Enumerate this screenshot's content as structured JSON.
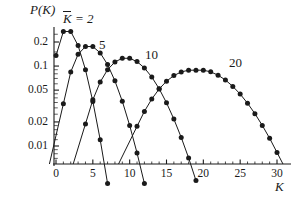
{
  "chart_data": {
    "type": "line",
    "title": "",
    "subtitle": "",
    "xlabel": "K",
    "ylabel": "P(K)",
    "yscale": "log",
    "xscale": "linear",
    "xlim": [
      0,
      30
    ],
    "ylim": [
      0.007,
      0.27
    ],
    "grid": false,
    "legend_position": "inline-annotations",
    "x_ticks": [
      "0",
      "5",
      "10",
      "15",
      "20",
      "25",
      "30"
    ],
    "x_tick_values": [
      0,
      5,
      10,
      15,
      20,
      25,
      30
    ],
    "y_ticks": [
      "0.2",
      "0.1",
      "0.05",
      "0.02",
      "0.01"
    ],
    "y_tick_values": [
      0.2,
      0.1,
      0.05,
      0.02,
      0.01
    ],
    "annotations": [
      {
        "text": "K = 2",
        "overline": "K",
        "x": 2.2,
        "y": 0.255
      },
      {
        "text": "5",
        "x": 6.5,
        "y": 0.185
      },
      {
        "text": "10",
        "x": 13.0,
        "y": 0.155
      },
      {
        "text": "20",
        "x": 24.0,
        "y": 0.125
      }
    ],
    "series": [
      {
        "name": "K = 2",
        "mean": 2,
        "marker": "filled-circle",
        "x": [
          0,
          1,
          2,
          3,
          4,
          5,
          6,
          7
        ],
        "values": [
          0.1353,
          0.2707,
          0.2707,
          0.1804,
          0.0902,
          0.0361,
          0.012,
          0.0034
        ]
      },
      {
        "name": "5",
        "mean": 5,
        "marker": "filled-circle",
        "x": [
          1,
          2,
          3,
          4,
          5,
          6,
          7,
          8,
          9,
          10,
          11,
          12
        ],
        "values": [
          0.0337,
          0.0842,
          0.1404,
          0.1755,
          0.1755,
          0.1462,
          0.1044,
          0.0653,
          0.0363,
          0.0181,
          0.0082,
          0.0034
        ]
      },
      {
        "name": "10",
        "mean": 10,
        "marker": "filled-circle",
        "x": [
          4,
          5,
          6,
          7,
          8,
          9,
          10,
          11,
          12,
          13,
          14,
          15,
          16,
          17,
          18,
          19
        ],
        "values": [
          0.0189,
          0.0378,
          0.0631,
          0.0901,
          0.1126,
          0.1251,
          0.1251,
          0.1137,
          0.0948,
          0.0729,
          0.0521,
          0.0347,
          0.0217,
          0.0128,
          0.0071,
          0.0037
        ]
      },
      {
        "name": "20",
        "mean": 20,
        "marker": "filled-circle",
        "x": [
          11,
          12,
          13,
          14,
          15,
          16,
          17,
          18,
          19,
          20,
          21,
          22,
          23,
          24,
          25,
          26,
          27,
          28,
          29,
          30
        ],
        "values": [
          0.0176,
          0.0271,
          0.0387,
          0.0516,
          0.0646,
          0.076,
          0.0844,
          0.0888,
          0.0888,
          0.0888,
          0.0846,
          0.0769,
          0.0669,
          0.0557,
          0.0446,
          0.0343,
          0.0254,
          0.0181,
          0.0125,
          0.0083
        ]
      }
    ]
  },
  "style": {
    "line_color": "#1a1a1a",
    "marker_color": "#1a1a1a",
    "axis_color": "#1a1a1a",
    "background": "#ffffff"
  }
}
